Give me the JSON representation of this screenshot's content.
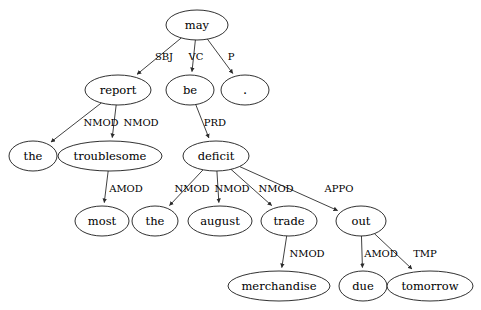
{
  "figure": {
    "background_color": "#ffffff",
    "node_fill": "#ffffff",
    "node_stroke": "#1a1a1a",
    "edge_color": "#2b2b2b",
    "text_color": "#000000",
    "clipped_header_text": ""
  },
  "chart_data": {
    "type": "diagram",
    "diagram_type": "dependency-tree",
    "title": "",
    "root": "may",
    "nodes": [
      {
        "id": "may",
        "label": "may",
        "x": 197,
        "y": 25,
        "rx": 31,
        "ry": 15
      },
      {
        "id": "report",
        "label": "report",
        "x": 118,
        "y": 90,
        "rx": 33,
        "ry": 15
      },
      {
        "id": "be",
        "label": "be",
        "x": 190,
        "y": 90,
        "rx": 24,
        "ry": 15
      },
      {
        "id": "period",
        "label": ".",
        "x": 245,
        "y": 90,
        "rx": 24,
        "ry": 15
      },
      {
        "id": "the1",
        "label": "the",
        "x": 33,
        "y": 156,
        "rx": 24,
        "ry": 15
      },
      {
        "id": "troublesome",
        "label": "troublesome",
        "x": 110,
        "y": 156,
        "rx": 52,
        "ry": 15
      },
      {
        "id": "deficit",
        "label": "deficit",
        "x": 216,
        "y": 156,
        "rx": 33,
        "ry": 15
      },
      {
        "id": "most",
        "label": "most",
        "x": 102,
        "y": 221,
        "rx": 27,
        "ry": 15
      },
      {
        "id": "the2",
        "label": "the",
        "x": 155,
        "y": 221,
        "rx": 23,
        "ry": 15
      },
      {
        "id": "august",
        "label": "august",
        "x": 220,
        "y": 221,
        "rx": 32,
        "ry": 15
      },
      {
        "id": "trade",
        "label": "trade",
        "x": 289,
        "y": 221,
        "rx": 28,
        "ry": 15
      },
      {
        "id": "out",
        "label": "out",
        "x": 361,
        "y": 221,
        "rx": 25,
        "ry": 15
      },
      {
        "id": "merchandise",
        "label": "merchandise",
        "x": 279,
        "y": 286,
        "rx": 51,
        "ry": 15
      },
      {
        "id": "due",
        "label": "due",
        "x": 363,
        "y": 286,
        "rx": 24,
        "ry": 15
      },
      {
        "id": "tomorrow",
        "label": "tomorrow",
        "x": 430,
        "y": 286,
        "rx": 43,
        "ry": 15
      }
    ],
    "edges": [
      {
        "from": "may",
        "to": "report",
        "label": "SBJ",
        "lx": 164,
        "ly": 57
      },
      {
        "from": "may",
        "to": "be",
        "label": "VC",
        "lx": 196,
        "ly": 57
      },
      {
        "from": "may",
        "to": "period",
        "label": "P",
        "lx": 231,
        "ly": 57
      },
      {
        "from": "report",
        "to": "the1",
        "label": "NMOD",
        "lx": 101,
        "ly": 123
      },
      {
        "from": "report",
        "to": "troublesome",
        "label": "NMOD",
        "lx": 141,
        "ly": 123
      },
      {
        "from": "be",
        "to": "deficit",
        "label": "PRD",
        "lx": 215,
        "ly": 123
      },
      {
        "from": "troublesome",
        "to": "most",
        "label": "AMOD",
        "lx": 126,
        "ly": 189
      },
      {
        "from": "deficit",
        "to": "the2",
        "label": "NMOD",
        "lx": 192,
        "ly": 189
      },
      {
        "from": "deficit",
        "to": "august",
        "label": "NMOD",
        "lx": 232,
        "ly": 189
      },
      {
        "from": "deficit",
        "to": "trade",
        "label": "NMOD",
        "lx": 276,
        "ly": 189
      },
      {
        "from": "deficit",
        "to": "out",
        "label": "APPO",
        "lx": 339,
        "ly": 189
      },
      {
        "from": "trade",
        "to": "merchandise",
        "label": "NMOD",
        "lx": 307,
        "ly": 254
      },
      {
        "from": "out",
        "to": "due",
        "label": "AMOD",
        "lx": 381,
        "ly": 254
      },
      {
        "from": "out",
        "to": "tomorrow",
        "label": "TMP",
        "lx": 425,
        "ly": 254
      }
    ],
    "sentence": "the troublesome most report may be the august trade deficit out due tomorrow",
    "relation_types": [
      "SBJ",
      "VC",
      "P",
      "NMOD",
      "PRD",
      "AMOD",
      "APPO",
      "TMP"
    ]
  }
}
